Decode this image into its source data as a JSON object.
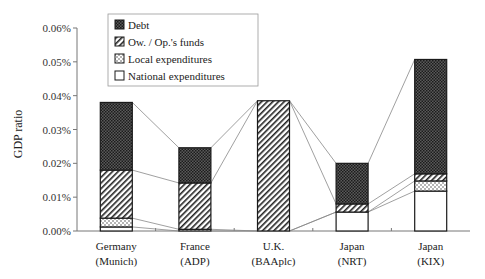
{
  "chart_data": {
    "type": "bar",
    "stacked": true,
    "title": "",
    "xlabel": "",
    "ylabel": "GDP ratio",
    "ylim": [
      0,
      0.06
    ],
    "yticks": [
      "0.00%",
      "0.01%",
      "0.02%",
      "0.03%",
      "0.04%",
      "0.05%",
      "0.06%"
    ],
    "grid": false,
    "legend_position": "upper-left-inside",
    "categories": [
      "Germany (Munich)",
      "France (ADP)",
      "U.K. (BAAplc)",
      "Japan (NRT)",
      "Japan (KIX)"
    ],
    "category_lines": [
      [
        "Germany",
        "(Munich)"
      ],
      [
        "France",
        "(ADP)"
      ],
      [
        "U.K.",
        "(BAAplc)"
      ],
      [
        "Japan",
        "(NRT)"
      ],
      [
        "Japan",
        "(KIX)"
      ]
    ],
    "series": [
      {
        "name": "National expenditures",
        "pattern": "white",
        "values": [
          0.0012,
          0.0,
          0.0,
          0.0056,
          0.0118
        ]
      },
      {
        "name": "Local expenditures",
        "pattern": "dotted",
        "values": [
          0.0026,
          0.0005,
          0.0,
          0.0,
          0.003
        ]
      },
      {
        "name": "Ow. / Op.'s funds",
        "pattern": "hatched",
        "values": [
          0.0142,
          0.0137,
          0.0385,
          0.0024,
          0.0021
        ]
      },
      {
        "name": "Debt",
        "pattern": "dark",
        "values": [
          0.02,
          0.0104,
          0.0,
          0.012,
          0.0338
        ]
      }
    ],
    "totals": [
      0.038,
      0.0246,
      0.0385,
      0.02,
      0.0507
    ],
    "legend_order": [
      "Debt",
      "Ow. / Op.'s funds",
      "Local expenditures",
      "National expenditures"
    ]
  },
  "colors": {
    "axis": "#777777",
    "bar_outline": "#1a1a1a",
    "debt_fill": "#3a3a3a",
    "connector": "#888888"
  }
}
